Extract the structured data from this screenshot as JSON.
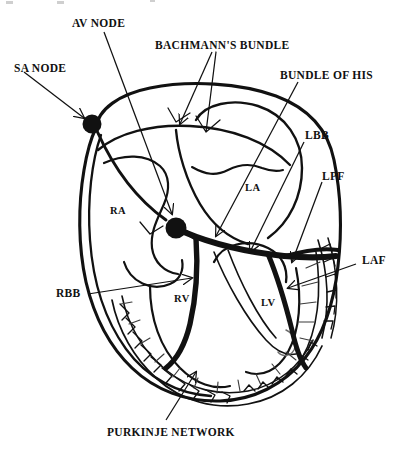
{
  "figure": {
    "type": "anatomical-line-drawing",
    "colors": {
      "ink": "#111111",
      "background": "#ffffff",
      "node_fill": "#111111",
      "conduction_path": "#111111"
    }
  },
  "callout_labels": [
    {
      "id": "sa-node",
      "text": "SA NODE",
      "x": 14,
      "y": 63,
      "points_to": "sinoatrial node marker on right atrial wall"
    },
    {
      "id": "av-node",
      "text": "AV NODE",
      "x": 72,
      "y": 18,
      "points_to": "atrioventricular node marker at septum"
    },
    {
      "id": "bachmanns-bundle",
      "text": "BACHMANN'S BUNDLE",
      "x": 155,
      "y": 40,
      "points_to": "interatrial band in left atrium"
    },
    {
      "id": "bundle-of-his",
      "text": "BUNDLE OF HIS",
      "x": 280,
      "y": 70,
      "points_to": "common bundle below AV node"
    },
    {
      "id": "purkinje-network",
      "text": "PURKINJE NETWORK",
      "x": 107,
      "y": 427,
      "points_to": "feathered subendocardial network at apex"
    }
  ],
  "branch_labels": [
    {
      "id": "lbb",
      "text": "LBB",
      "x": 305,
      "y": 130,
      "full_name": "left bundle branch"
    },
    {
      "id": "lpf",
      "text": "LPF",
      "x": 322,
      "y": 171,
      "full_name": "left posterior fascicle"
    },
    {
      "id": "laf",
      "text": "LAF",
      "x": 362,
      "y": 255,
      "full_name": "left anterior fascicle"
    },
    {
      "id": "rbb",
      "text": "RBB",
      "x": 56,
      "y": 288,
      "full_name": "right bundle branch"
    }
  ],
  "chamber_labels": [
    {
      "id": "ra",
      "text": "RA",
      "x": 110,
      "y": 206,
      "full_name": "right atrium"
    },
    {
      "id": "la",
      "text": "LA",
      "x": 245,
      "y": 183,
      "full_name": "left atrium"
    },
    {
      "id": "rv",
      "text": "RV",
      "x": 174,
      "y": 294,
      "full_name": "right ventricle"
    },
    {
      "id": "lv",
      "text": "LV",
      "x": 261,
      "y": 298,
      "full_name": "left ventricle"
    }
  ],
  "nodes": [
    {
      "id": "sa-node-marker",
      "cx": 92,
      "cy": 124,
      "r": 9.5
    },
    {
      "id": "av-node-marker",
      "cx": 176,
      "cy": 228,
      "r": 10.5
    }
  ]
}
